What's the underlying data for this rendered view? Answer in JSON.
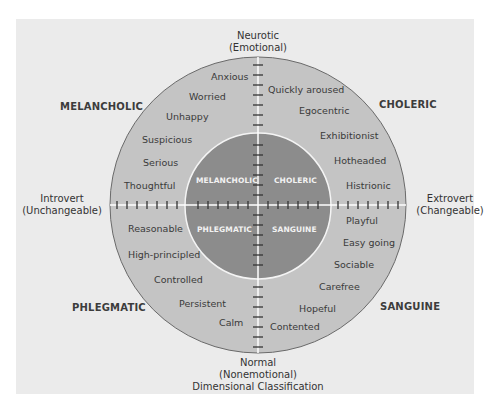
{
  "diagram": {
    "title": "Dimensional Classification",
    "colors": {
      "background": "#ebebeb",
      "outer_circle": "#c4c4c4",
      "inner_circle": "#8c8c8c",
      "inner_text": "#f2f2f2",
      "axis_line": "#ffffff"
    },
    "axes": {
      "top": {
        "line1": "Neurotic",
        "line2": "(Emotional)"
      },
      "bottom": {
        "line1": "Normal",
        "line2": "(Nonemotional)",
        "line3": "Dimensional Classification"
      },
      "left": {
        "line1": "Introvert",
        "line2": "(Unchangeable)"
      },
      "right": {
        "line1": "Extrovert",
        "line2": "(Changeable)"
      }
    },
    "corner_labels": {
      "top_left": "MELANCHOLIC",
      "top_right": "CHOLERIC",
      "bottom_left": "PHLEGMATIC",
      "bottom_right": "SANGUINE"
    },
    "inner_labels": {
      "top_left": "MELANCHOLIC",
      "top_right": "CHOLERIC",
      "bottom_left": "PHLEGMATIC",
      "bottom_right": "SANGUINE"
    },
    "traits": {
      "melancholic": [
        "Anxious",
        "Worried",
        "Unhappy",
        "Suspicious",
        "Serious",
        "Thoughtful"
      ],
      "choleric": [
        "Quickly aroused",
        "Egocentric",
        "Exhibitionist",
        "Hotheaded",
        "Histrionic"
      ],
      "phlegmatic": [
        "Reasonable",
        "High-principled",
        "Controlled",
        "Persistent",
        "Calm"
      ],
      "sanguine": [
        "Playful",
        "Easy going",
        "Sociable",
        "Carefree",
        "Hopeful",
        "Contented"
      ]
    }
  }
}
